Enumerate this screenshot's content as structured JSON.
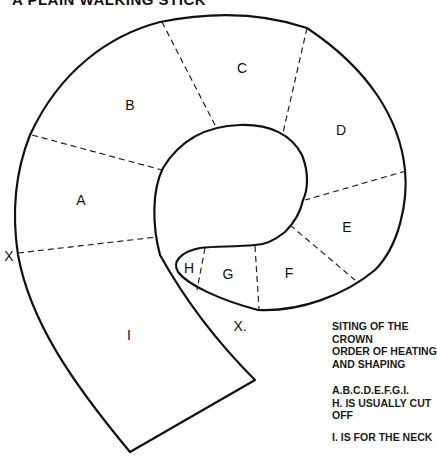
{
  "title": "A PLAIN WALKING STICK",
  "segments": [
    {
      "id": "A",
      "label": "A"
    },
    {
      "id": "B",
      "label": "B"
    },
    {
      "id": "C",
      "label": "C"
    },
    {
      "id": "D",
      "label": "D"
    },
    {
      "id": "E",
      "label": "E"
    },
    {
      "id": "F",
      "label": "F"
    },
    {
      "id": "G",
      "label": "G"
    },
    {
      "id": "H",
      "label": "H"
    },
    {
      "id": "I",
      "label": "I"
    }
  ],
  "markers": {
    "x_left": "X",
    "x_bottom": "X."
  },
  "notes": {
    "line1": "SITING OF THE",
    "line2": "CROWN",
    "line3": "ORDER OF HEATING",
    "line4": "AND SHAPING",
    "line5": "A.B.C.D.E.F.G.I.",
    "line6": "H. IS USUALLY CUT",
    "line7": "OFF",
    "line8": "I. IS FOR THE NECK"
  },
  "colors": {
    "stroke": "#111111",
    "background": "#ffffff"
  }
}
